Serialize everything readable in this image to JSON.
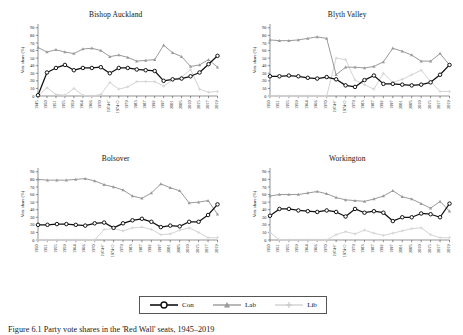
{
  "figure": {
    "caption_label": "Figure 6.1",
    "caption_text": "Figure 6.1   Party vote shares in the 'Red Wall' seats, 1945–2019",
    "ylabel": "Vote share (%)",
    "y_ticks": [
      0,
      10,
      20,
      30,
      40,
      50,
      60,
      70,
      80,
      90
    ],
    "ylim": [
      0,
      95
    ]
  },
  "legend": {
    "position": "bottom-center",
    "items": [
      {
        "label": "Con",
        "color": "#111111",
        "marker": "circle"
      },
      {
        "label": "Lab",
        "color": "#9a9a9a",
        "marker": "triangle"
      },
      {
        "label": "Lib",
        "color": "#d2d2d2",
        "marker": "plus"
      }
    ]
  },
  "colors": {
    "con": "#111111",
    "lab": "#9a9a9a",
    "lib": "#d4d4d4",
    "axis": "#4a4a4a",
    "background": "#ffffff"
  },
  "chart_data": [
    {
      "type": "line",
      "title": "Bishop Auckland",
      "xlabel": "",
      "ylabel": "Vote share (%)",
      "ylim": [
        0,
        95
      ],
      "grid": false,
      "legend": "bottom",
      "categories": [
        "1945",
        "1950",
        "1951",
        "1955",
        "1959",
        "1964",
        "1966",
        "1970",
        "1974-F",
        "1974-O",
        "1979",
        "1983",
        "1987",
        "1992",
        "1997",
        "2001",
        "2005",
        "2010",
        "2015",
        "2017",
        "2019"
      ],
      "series": [
        {
          "name": "Con",
          "values": [
            1,
            31,
            37,
            41,
            34,
            37,
            37,
            38,
            30,
            37,
            37,
            35,
            34,
            33,
            20,
            22,
            23,
            26,
            31,
            42,
            53
          ]
        },
        {
          "name": "Lab",
          "values": [
            64,
            58,
            61,
            58,
            56,
            62,
            63,
            60,
            52,
            54,
            51,
            46,
            47,
            48,
            67,
            57,
            52,
            39,
            41,
            48,
            38
          ]
        },
        {
          "name": "Lib",
          "values": [
            0,
            11,
            2,
            1,
            10,
            1,
            0,
            2,
            18,
            9,
            12,
            19,
            19,
            19,
            13,
            21,
            25,
            35,
            9,
            5,
            6
          ]
        }
      ]
    },
    {
      "type": "line",
      "title": "Blyth Valley",
      "xlabel": "",
      "ylabel": "Vote share (%)",
      "ylim": [
        0,
        95
      ],
      "grid": false,
      "legend": "bottom",
      "categories": [
        "1950",
        "1951",
        "1955",
        "1959",
        "1964",
        "1966",
        "1970",
        "1974-F",
        "1974-O",
        "1979",
        "1983",
        "1987",
        "1992",
        "1997",
        "2001",
        "2005",
        "2010",
        "2015",
        "2017",
        "2019"
      ],
      "series": [
        {
          "name": "Con",
          "values": [
            26,
            26,
            27,
            26,
            24,
            23,
            25,
            22,
            14,
            12,
            21,
            27,
            16,
            16,
            15,
            14,
            15,
            18,
            28,
            41
          ]
        },
        {
          "name": "Lab",
          "values": [
            74,
            73,
            73,
            74,
            76,
            78,
            76,
            28,
            38,
            38,
            37,
            39,
            45,
            63,
            59,
            54,
            46,
            46,
            56,
            41
          ]
        },
        {
          "name": "Lib",
          "values": [
            0,
            0,
            0,
            0,
            0,
            0,
            0,
            50,
            48,
            21,
            15,
            9,
            30,
            18,
            22,
            28,
            34,
            19,
            6,
            6
          ]
        }
      ]
    },
    {
      "type": "line",
      "title": "Bolsover",
      "xlabel": "",
      "ylabel": "Vote share (%)",
      "ylim": [
        0,
        95
      ],
      "grid": false,
      "legend": "bottom",
      "categories": [
        "1950",
        "1951",
        "1955",
        "1959",
        "1964",
        "1966",
        "1970",
        "1974-F",
        "1974-O",
        "1979",
        "1983",
        "1987",
        "1992",
        "1997",
        "2001",
        "2005",
        "2010",
        "2015",
        "2017",
        "2019"
      ],
      "series": [
        {
          "name": "Con",
          "values": [
            20,
            20,
            21,
            21,
            20,
            19,
            22,
            23,
            16,
            22,
            26,
            28,
            24,
            17,
            19,
            18,
            24,
            24,
            33,
            47
          ]
        },
        {
          "name": "Lab",
          "values": [
            80,
            79,
            79,
            79,
            80,
            81,
            78,
            73,
            70,
            66,
            58,
            55,
            62,
            74,
            69,
            65,
            49,
            50,
            52,
            34
          ]
        },
        {
          "name": "Lib",
          "values": [
            0,
            0,
            0,
            0,
            0,
            0,
            0,
            14,
            15,
            12,
            16,
            17,
            14,
            7,
            8,
            13,
            16,
            10,
            3,
            3
          ]
        }
      ]
    },
    {
      "type": "line",
      "title": "Workington",
      "xlabel": "",
      "ylabel": "Vote share (%)",
      "ylim": [
        0,
        95
      ],
      "grid": false,
      "legend": "bottom",
      "categories": [
        "1950",
        "1951",
        "1955",
        "1959",
        "1964",
        "1966",
        "1970",
        "1974-F",
        "1974-O",
        "1979",
        "1983",
        "1987",
        "1992",
        "1997",
        "2001",
        "2005",
        "2010",
        "2015",
        "2017",
        "2019"
      ],
      "series": [
        {
          "name": "Con",
          "values": [
            32,
            41,
            41,
            39,
            38,
            37,
            39,
            37,
            31,
            41,
            36,
            38,
            36,
            25,
            30,
            30,
            35,
            34,
            30,
            48
          ]
        },
        {
          "name": "Lab",
          "values": [
            58,
            60,
            60,
            60,
            62,
            64,
            61,
            56,
            53,
            52,
            51,
            54,
            58,
            65,
            57,
            54,
            48,
            42,
            51,
            38
          ]
        },
        {
          "name": "Lib",
          "values": [
            10,
            0,
            0,
            0,
            0,
            0,
            0,
            7,
            11,
            8,
            13,
            9,
            6,
            9,
            12,
            15,
            16,
            7,
            3,
            3
          ]
        }
      ]
    }
  ]
}
